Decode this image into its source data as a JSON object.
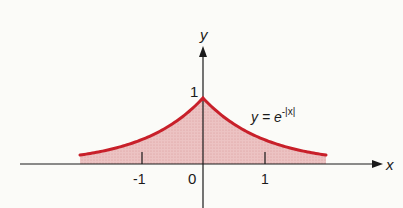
{
  "chart_data": {
    "type": "area",
    "title": "",
    "function": "y = e^{-|x|}",
    "xlabel": "x",
    "ylabel": "y",
    "x_ticks": [
      -1,
      0,
      1
    ],
    "x_tick_labels": [
      "-1",
      "0",
      "1"
    ],
    "y_ticks": [
      1
    ],
    "y_tick_labels": [
      "1"
    ],
    "xlim": [
      -3.3,
      2.95
    ],
    "ylim": [
      0,
      1.5
    ],
    "grid": false,
    "legend": null,
    "annotation": "y = e^{-|x|}",
    "series": [
      {
        "name": "y = e^{-|x|}",
        "x": [
          -2,
          -1.5,
          -1,
          -0.5,
          0,
          0.5,
          1,
          1.5,
          2
        ],
        "values": [
          0.135,
          0.223,
          0.368,
          0.607,
          1.0,
          0.607,
          0.368,
          0.223,
          0.135
        ]
      }
    ],
    "fill_under_curve": true,
    "colors": {
      "curve": "#c8202a",
      "fill": "#e8b4b4",
      "axis": "#1a1a1a"
    }
  },
  "labels": {
    "y_axis": "y",
    "x_axis": "x",
    "tick_neg1": "-1",
    "tick_0": "0",
    "tick_1": "1",
    "ytick_1": "1",
    "eq_y": "y",
    "eq_eq": " = e",
    "eq_exp": "-|x|"
  }
}
